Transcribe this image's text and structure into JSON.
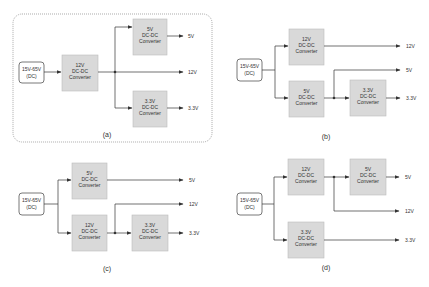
{
  "panels": [
    {
      "id": "a",
      "caption": "(a)",
      "input": {
        "line1": "15V-65V",
        "line2": "(DC)"
      },
      "converters": [
        {
          "line1": "12V",
          "line2": "DC-DC",
          "line3": "Converter"
        },
        {
          "line1": "5V",
          "line2": "DC-DC",
          "line3": "Converter"
        },
        {
          "line1": "3.3V",
          "line2": "DC-DC",
          "line3": "Converter"
        }
      ],
      "outputs": [
        "5V",
        "12V",
        "3.3V"
      ]
    },
    {
      "id": "b",
      "caption": "(b)",
      "input": {
        "line1": "15V-65V",
        "line2": "(DC)"
      },
      "converters": [
        {
          "line1": "12V",
          "line2": "DC-DC",
          "line3": "Converter"
        },
        {
          "line1": "5V",
          "line2": "DC-DC",
          "line3": "Converter"
        },
        {
          "line1": "3.3V",
          "line2": "DC-DC",
          "line3": "Converter"
        }
      ],
      "outputs": [
        "12V",
        "5V",
        "3.3V"
      ]
    },
    {
      "id": "c",
      "caption": "(c)",
      "input": {
        "line1": "15V-65V",
        "line2": "(DC)"
      },
      "converters": [
        {
          "line1": "5V",
          "line2": "DC-DC",
          "line3": "Converter"
        },
        {
          "line1": "12V",
          "line2": "DC-DC",
          "line3": "Converter"
        },
        {
          "line1": "3.3V",
          "line2": "DC-DC",
          "line3": "Converter"
        }
      ],
      "outputs": [
        "5V",
        "12V",
        "3.3V"
      ]
    },
    {
      "id": "d",
      "caption": "(d)",
      "input": {
        "line1": "15V-65V",
        "line2": "(DC)"
      },
      "converters": [
        {
          "line1": "12V",
          "line2": "DC-DC",
          "line3": "Converter"
        },
        {
          "line1": "5V",
          "line2": "DC-DC",
          "line3": "Converter"
        },
        {
          "line1": "3.3V",
          "line2": "DC-DC",
          "line3": "Converter"
        }
      ],
      "outputs": [
        "5V",
        "12V",
        "3.3V"
      ]
    }
  ],
  "colors": {
    "converter_fill": "#d9d9d9",
    "converter_stroke": "#bdbdbd",
    "wire": "#333333",
    "dashed_border": "#888888"
  }
}
